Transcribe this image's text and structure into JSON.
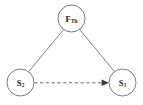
{
  "figure": {
    "kind": "node-link-diagram",
    "background_color": "#ffffff",
    "width": 143,
    "height": 105
  },
  "nodes": [
    {
      "id": "f-th",
      "name": "node-f-th",
      "label_main": "F",
      "label_sub": "Th",
      "cx": 71.5,
      "cy": 18.5,
      "r": 13.5,
      "stroke_color": "#6b6b6b",
      "fill_color": "#ffffff"
    },
    {
      "id": "s2",
      "name": "node-s2",
      "label_main": "S",
      "label_sub": "2",
      "cx": 20.5,
      "cy": 82.5,
      "r": 13.5,
      "stroke_color": "#6b6b6b",
      "fill_color": "#ffffff"
    },
    {
      "id": "s1",
      "name": "node-s1",
      "label_main": "S",
      "label_sub": "1",
      "cx": 122.5,
      "cy": 82.5,
      "r": 13.5,
      "stroke_color": "#6b6b6b",
      "fill_color": "#ffffff"
    }
  ],
  "edges": [
    {
      "id": "edge-s2-fth",
      "name": "edge-s2-to-f-th",
      "style": "solid",
      "from": "s2",
      "to": "f-th",
      "arrow": false,
      "color": "#6f6f6f",
      "x1": 28.6,
      "y1": 71.7,
      "x2": 63.6,
      "y2": 29.5
    },
    {
      "id": "edge-fth-s1",
      "name": "edge-f-th-to-s1",
      "style": "solid",
      "from": "f-th",
      "to": "s1",
      "arrow": false,
      "color": "#6f6f6f",
      "x1": 79.6,
      "y1": 29.4,
      "x2": 114.6,
      "y2": 71.8
    },
    {
      "id": "edge-s2-s1",
      "name": "edge-s2-to-s1-dashed",
      "style": "dashed",
      "from": "s2",
      "to": "s1",
      "arrow": true,
      "color": "#5a5a5a",
      "x1": 34.2,
      "y1": 82.8,
      "x2": 108.8,
      "y2": 82.8
    }
  ],
  "arrowheads": [
    {
      "name": "arrowhead-into-s1",
      "points": "108.9,82.8 101.6,79.5 101.6,86.1",
      "color": "#3a3a3a"
    }
  ]
}
